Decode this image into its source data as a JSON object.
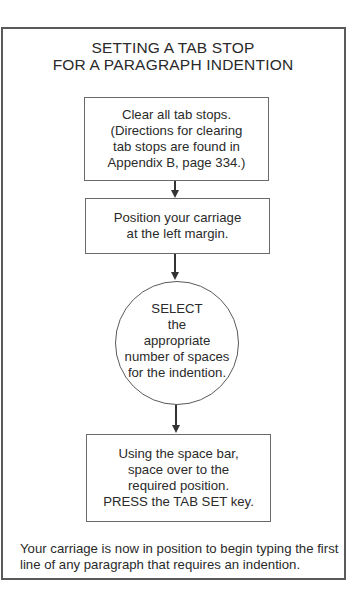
{
  "diagram": {
    "title": {
      "line1": "SETTING A TAB STOP",
      "line2": "FOR A PARAGRAPH INDENTION"
    },
    "steps": [
      {
        "shape": "rectangle",
        "lines": [
          "Clear all tab stops.",
          "(Directions for clearing",
          "tab stops are found in",
          "Appendix B, page 334.)"
        ]
      },
      {
        "shape": "rectangle",
        "lines": [
          "Position your carriage",
          "at the left margin."
        ]
      },
      {
        "shape": "circle",
        "lines": [
          "SELECT",
          "the",
          "appropriate",
          "number of spaces",
          "for the indention."
        ]
      },
      {
        "shape": "rectangle",
        "lines": [
          "Using the space bar,",
          "space over to the",
          "required position.",
          "PRESS the TAB SET key."
        ]
      }
    ],
    "arrows": [
      {
        "from": 0,
        "to": 1,
        "direction": "down"
      },
      {
        "from": 1,
        "to": 2,
        "direction": "down"
      },
      {
        "from": 2,
        "to": 3,
        "direction": "down"
      }
    ],
    "footer": {
      "line1": "Your carriage is now in position to begin typing the first",
      "line2": "line of any paragraph that requires an indention."
    },
    "colors": {
      "background": "#ffffff",
      "border": "#5a5a5a",
      "text": "#2a2a2a"
    }
  }
}
